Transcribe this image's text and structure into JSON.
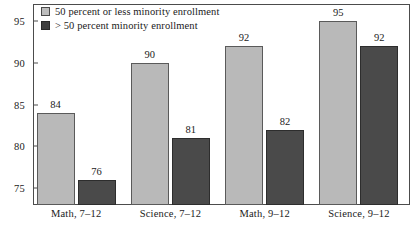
{
  "chart_data": {
    "type": "bar",
    "title": "",
    "xlabel": "",
    "ylabel": "",
    "ylim": [
      73,
      97
    ],
    "grid": false,
    "legend_position": "top-left",
    "categories": [
      "Math, 7–12",
      "Science, 7–12",
      "Math, 9–12",
      "Science, 9–12"
    ],
    "yticks": [
      75,
      80,
      85,
      90,
      95
    ],
    "ytick_labels": [
      "75",
      "80",
      "85",
      "90",
      "95"
    ],
    "series": [
      {
        "name": "50 percent or less minority enrollment",
        "color": "#b9b9b9",
        "values": [
          84,
          90,
          92,
          95
        ],
        "value_labels": [
          "84",
          "90",
          "92",
          "95"
        ]
      },
      {
        "name": "> 50 percent minority enrollment",
        "color": "#4a4a4a",
        "values": [
          76,
          81,
          82,
          92
        ],
        "value_labels": [
          "76",
          "81",
          "82",
          "92"
        ]
      }
    ]
  },
  "legend": {
    "items": [
      {
        "label": "50 percent or less minority enrollment",
        "swatch": "legend-swatch-light"
      },
      {
        "label": "> 50 percent minority enrollment",
        "swatch": "legend-swatch-dark"
      }
    ]
  }
}
